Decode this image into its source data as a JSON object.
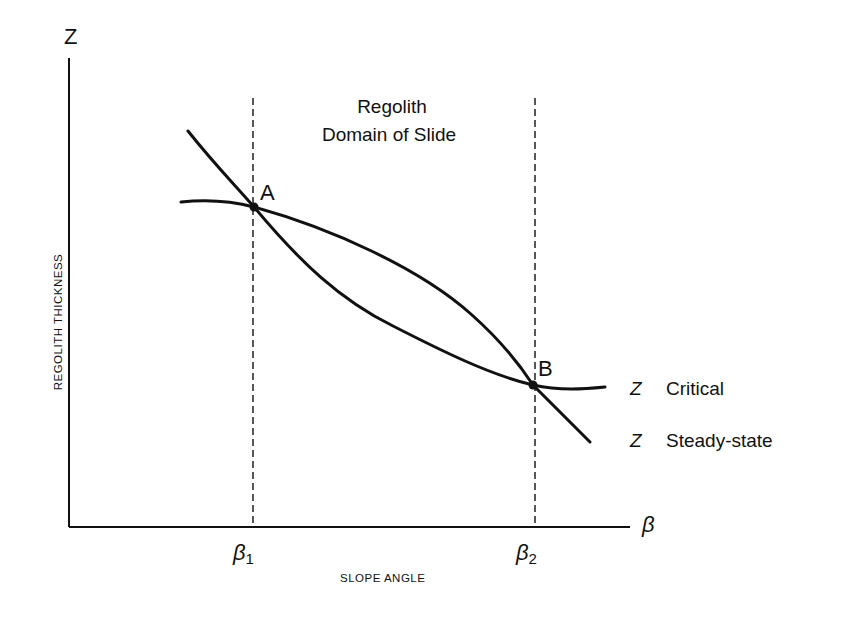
{
  "diagram": {
    "title_lines": [
      "Regolith",
      "Domain of Slide"
    ],
    "y_axis": {
      "symbol": "Z",
      "label": "REGOLITH THICKNESS"
    },
    "x_axis": {
      "symbol": "β",
      "label": "SLOPE ANGLE"
    },
    "ticks": [
      {
        "symbol": "β",
        "subscript": "1"
      },
      {
        "symbol": "β",
        "subscript": "2"
      }
    ],
    "points": [
      {
        "label": "A"
      },
      {
        "label": "B"
      }
    ],
    "legend": [
      {
        "symbol": "Z",
        "label": "Critical"
      },
      {
        "symbol": "Z",
        "label": "Steady-state"
      }
    ],
    "colors": {
      "ink": "#111111",
      "background": "#ffffff"
    }
  }
}
